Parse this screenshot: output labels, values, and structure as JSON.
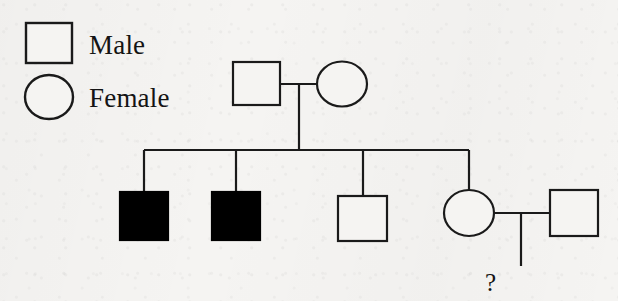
{
  "figure": {
    "kind": "pedigree-chart",
    "background_color": "#f5f4f2",
    "stroke_color": "#1a1a1a",
    "affected_fill_color": "#000000",
    "unaffected_fill_color": "#f5f4f2",
    "stroke_width": 2
  },
  "legend": {
    "male": {
      "label": "Male",
      "symbol": "square",
      "filled": false
    },
    "female": {
      "label": "Female",
      "symbol": "circle",
      "filled": false
    }
  },
  "generations": [
    {
      "id": "generation-1",
      "members": [
        {
          "id": "father",
          "symbol": "square",
          "sex": "male",
          "affected": false,
          "label": ""
        },
        {
          "id": "mother",
          "symbol": "circle",
          "sex": "female",
          "affected": false,
          "label": ""
        }
      ]
    },
    {
      "id": "generation-2",
      "members": [
        {
          "id": "child-1",
          "symbol": "square",
          "sex": "male",
          "affected": true,
          "label": ""
        },
        {
          "id": "child-2",
          "symbol": "square",
          "sex": "male",
          "affected": true,
          "label": ""
        },
        {
          "id": "child-3",
          "symbol": "square",
          "sex": "male",
          "affected": false,
          "label": ""
        },
        {
          "id": "child-4",
          "symbol": "circle",
          "sex": "female",
          "affected": false,
          "label": ""
        },
        {
          "id": "child-4-spouse",
          "symbol": "square",
          "sex": "male",
          "affected": false,
          "label": ""
        }
      ]
    },
    {
      "id": "generation-3",
      "members": [
        {
          "id": "unknown-offspring",
          "symbol": "text",
          "sex": "unknown",
          "affected": null,
          "label": "?"
        }
      ]
    }
  ],
  "relationships": {
    "mating_line_1": "father - mother",
    "sibship": "child-1, child-2, child-3, child-4",
    "mating_line_2": "child-4 - child-4-spouse",
    "descent_unknown": "child-4 x child-4-spouse -> unknown-offspring"
  }
}
